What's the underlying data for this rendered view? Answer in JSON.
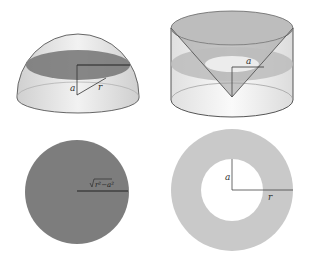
{
  "figures": [
    {
      "id": "hemisphere",
      "description": "Hemisphere of radius r with horizontal cross-section at height a",
      "labels": {
        "height": "a",
        "radius": "r"
      }
    },
    {
      "id": "cylinder-minus-cone",
      "description": "Cylinder with inscribed inverted cone; annular cross-section at height a",
      "labels": {
        "height": "a"
      }
    },
    {
      "id": "disk-cross-section",
      "description": "Disk cross-section of hemisphere",
      "labels": {
        "radius": "√(r²−a²)",
        "radius_radicand": "r²−a²"
      }
    },
    {
      "id": "annulus-cross-section",
      "description": "Annular cross-section: outer radius r, inner radius a",
      "labels": {
        "inner_radius": "a",
        "outer_radius": "r"
      }
    }
  ],
  "colors": {
    "dark_fill": "#7a7a7a",
    "light_fill": "#c8c8c8",
    "solid_fill": "#e6e6e6",
    "stroke": "#555555"
  }
}
